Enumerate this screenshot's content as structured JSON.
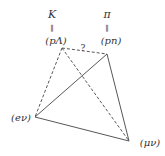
{
  "diagram": {
    "nodes": {
      "pL": {
        "top": "K",
        "eq": "‖",
        "label": "(pΛ)"
      },
      "pn": {
        "top": "π",
        "eq": "‖",
        "label": "(pn)"
      },
      "ev": {
        "label": "(eν)"
      },
      "mv": {
        "label": "(μν)"
      }
    },
    "question": "?",
    "edges": [
      {
        "from": "pL",
        "to": "pn",
        "style": "dashed",
        "label": "?"
      },
      {
        "from": "pL",
        "to": "ev",
        "style": "dashed"
      },
      {
        "from": "pL",
        "to": "mv",
        "style": "dashed"
      },
      {
        "from": "pn",
        "to": "ev",
        "style": "solid"
      },
      {
        "from": "pn",
        "to": "mv",
        "style": "solid"
      },
      {
        "from": "ev",
        "to": "mv",
        "style": "solid"
      }
    ],
    "color": "#333333"
  }
}
